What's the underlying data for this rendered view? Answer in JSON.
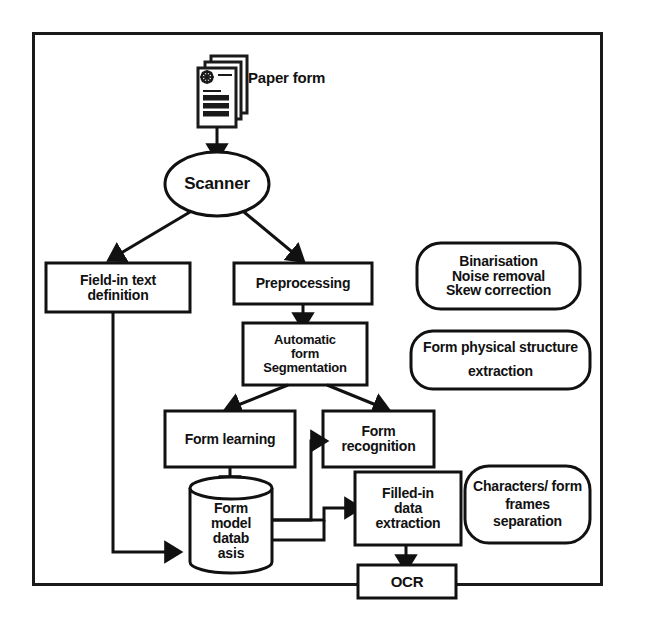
{
  "diagram": {
    "frame": {
      "name": "outer-frame",
      "stroke": "#1a1a1a"
    },
    "colors": {
      "stroke": "#111111",
      "fill": "#ffffff",
      "text": "#111111",
      "background": "#ffffff"
    },
    "nodes": [
      {
        "id": "paper-form-icon",
        "shape": "document-stack",
        "label": "Paper form",
        "label_position": "right"
      },
      {
        "id": "scanner",
        "shape": "ellipse",
        "label": "Scanner"
      },
      {
        "id": "field-in-text-definition",
        "shape": "rect",
        "label": "Field-in text\ndefinition"
      },
      {
        "id": "preprocessing",
        "shape": "rect",
        "label": "Preprocessing"
      },
      {
        "id": "automatic-form-segmentation",
        "shape": "rect",
        "label": "Automatic\nform\nSegmentation"
      },
      {
        "id": "form-learning",
        "shape": "rect",
        "label": "Form learning"
      },
      {
        "id": "form-recognition",
        "shape": "rect",
        "label": "Form\nrecognition"
      },
      {
        "id": "form-model-database",
        "shape": "cylinder",
        "label": "Form\nmodel\ndatab\nasis"
      },
      {
        "id": "filled-in-data-extraction",
        "shape": "rect",
        "label": "Filled-in\ndata\nextraction"
      },
      {
        "id": "ocr",
        "shape": "rect",
        "label": "OCR"
      }
    ],
    "annotations": [
      {
        "id": "annotation-preprocessing",
        "shape": "rounded-rect",
        "label": "Binarisation\nNoise removal\nSkew correction"
      },
      {
        "id": "annotation-segmentation",
        "shape": "rounded-rect",
        "label": "Form physical structure\nextraction"
      },
      {
        "id": "annotation-extraction",
        "shape": "rounded-rect",
        "label": "Characters/ form\nframes\nseparation"
      }
    ],
    "connectors": [
      {
        "id": "paper-form-to-scanner",
        "from": "paper-form-icon",
        "to": "scanner",
        "arrow": true
      },
      {
        "id": "scanner-to-field-in-text-definition",
        "from": "scanner",
        "to": "field-in-text-definition",
        "arrow": true
      },
      {
        "id": "scanner-to-preprocessing",
        "from": "scanner",
        "to": "preprocessing",
        "arrow": true
      },
      {
        "id": "preprocessing-to-segmentation",
        "from": "preprocessing",
        "to": "automatic-form-segmentation",
        "arrow": true
      },
      {
        "id": "segmentation-to-form-learning",
        "from": "automatic-form-segmentation",
        "to": "form-learning",
        "arrow": true
      },
      {
        "id": "segmentation-to-form-recognition",
        "from": "automatic-form-segmentation",
        "to": "form-recognition",
        "arrow": true
      },
      {
        "id": "form-learning-to-database",
        "from": "form-learning",
        "to": "form-model-database",
        "arrow": true
      },
      {
        "id": "field-in-text-definition-to-database",
        "from": "field-in-text-definition",
        "to": "form-model-database",
        "arrow": true
      },
      {
        "id": "database-to-form-recognition",
        "from": "form-model-database",
        "to": "form-recognition",
        "arrow": true
      },
      {
        "id": "database-to-filled-in-data-extraction-upper",
        "from": "form-model-database",
        "to": "filled-in-data-extraction",
        "arrow": true
      },
      {
        "id": "database-to-filled-in-data-extraction-lower",
        "from": "form-model-database",
        "to": "filled-in-data-extraction",
        "arrow": false
      },
      {
        "id": "filled-in-data-extraction-to-ocr",
        "from": "filled-in-data-extraction",
        "to": "ocr",
        "arrow": true
      }
    ]
  }
}
